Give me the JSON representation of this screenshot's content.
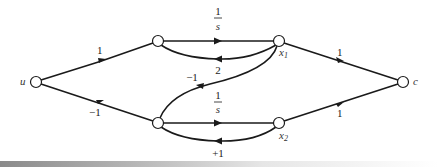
{
  "diagram": {
    "type": "signal-flow-graph",
    "nodes": [
      {
        "id": "u",
        "label": "u",
        "x": 36,
        "y": 82
      },
      {
        "id": "n1",
        "label": "",
        "x": 158,
        "y": 41
      },
      {
        "id": "x1",
        "label": "x",
        "sub": "1",
        "x": 279,
        "y": 41
      },
      {
        "id": "n2",
        "label": "",
        "x": 158,
        "y": 123
      },
      {
        "id": "x2",
        "label": "x",
        "sub": "2",
        "x": 279,
        "y": 123
      },
      {
        "id": "c",
        "label": "c",
        "x": 403,
        "y": 82
      }
    ],
    "edges": [
      {
        "from": "u",
        "to": "n1",
        "gain": "1"
      },
      {
        "from": "u",
        "to": "n2",
        "gain": "−1"
      },
      {
        "from": "n1",
        "to": "x1",
        "gain_num": "1",
        "gain_den": "s"
      },
      {
        "from": "x1",
        "to": "n1",
        "gain": "2"
      },
      {
        "from": "x1",
        "to": "n2",
        "gain": "−1"
      },
      {
        "from": "n2",
        "to": "x2",
        "gain_num": "1",
        "gain_den": "s"
      },
      {
        "from": "x2",
        "to": "n2",
        "gain": "+1"
      },
      {
        "from": "x1",
        "to": "c",
        "gain": "1"
      },
      {
        "from": "x2",
        "to": "c",
        "gain": "1"
      }
    ]
  },
  "labels": {
    "u": "u",
    "c": "c",
    "x1": "x",
    "x1_sub": "1",
    "x2": "x",
    "x2_sub": "2",
    "u_n1": "1",
    "u_n2": "−1",
    "n1_x1_num": "1",
    "n1_x1_den": "s",
    "x1_n1": "2",
    "x1_n2": "−1",
    "n2_x2_num": "1",
    "n2_x2_den": "s",
    "x2_n2": "+1",
    "x1_c": "1",
    "x2_c": "1"
  }
}
